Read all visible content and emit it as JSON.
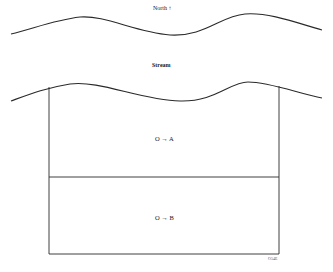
{
  "diagram": {
    "north_label": "North ↑",
    "stream_label": "Stream",
    "region_a_label": "O → A",
    "region_b_label": "O → B",
    "figure_code": "O54E",
    "colors": {
      "line": "#2a2a2a",
      "background": "#ffffff"
    }
  }
}
